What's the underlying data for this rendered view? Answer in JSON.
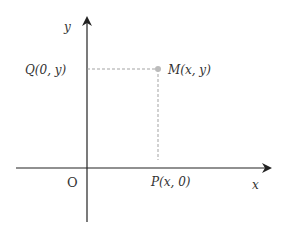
{
  "diagram": {
    "type": "cartesian-coordinate-system",
    "axes": {
      "x_label": "x",
      "y_label": "y",
      "origin_label": "O"
    },
    "points": {
      "M": {
        "label": "M(x, y)"
      },
      "P": {
        "label": "P(x, 0)"
      },
      "Q": {
        "label": "Q(0, y)"
      }
    },
    "colors": {
      "axis": "#222222",
      "dashed": "#999999",
      "point": "#bbbbbb",
      "text": "#333333"
    }
  }
}
